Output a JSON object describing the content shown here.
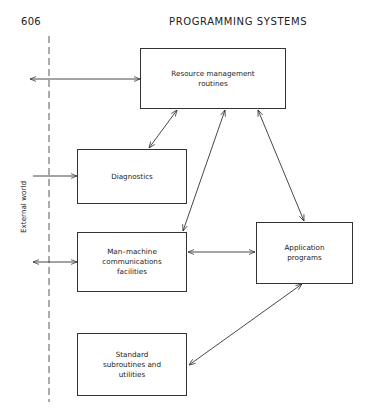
{
  "page": {
    "page_number": "606",
    "running_head": "PROGRAMMING SYSTEMS"
  },
  "diagram": {
    "boundary_label": "External world",
    "nodes": [
      {
        "id": "resource",
        "label": "Resource management\nroutines",
        "lines": [
          "Resource management",
          "routines"
        ]
      },
      {
        "id": "diagnostics",
        "label": "Diagnostics",
        "lines": [
          "Diagnostics"
        ]
      },
      {
        "id": "man_machine",
        "label": "Man–machine\ncommunications\nfacilities",
        "lines": [
          "Man–machine",
          "communications",
          "facilities"
        ]
      },
      {
        "id": "application",
        "label": "Application\nprograms",
        "lines": [
          "Application",
          "programs"
        ]
      },
      {
        "id": "standard",
        "label": "Standard\nsubroutines and\nutilities",
        "lines": [
          "Standard",
          "subroutines and",
          "utilities"
        ]
      }
    ],
    "edges": [
      {
        "from": "external_world",
        "to": "resource",
        "direction": "both"
      },
      {
        "from": "external_world",
        "to": "diagnostics",
        "direction": "to"
      },
      {
        "from": "external_world",
        "to": "man_machine",
        "direction": "both"
      },
      {
        "from": "resource",
        "to": "diagnostics",
        "direction": "both"
      },
      {
        "from": "resource",
        "to": "man_machine",
        "direction": "both"
      },
      {
        "from": "resource",
        "to": "application",
        "direction": "both"
      },
      {
        "from": "man_machine",
        "to": "application",
        "direction": "both"
      },
      {
        "from": "application",
        "to": "standard",
        "direction": "both"
      }
    ]
  }
}
